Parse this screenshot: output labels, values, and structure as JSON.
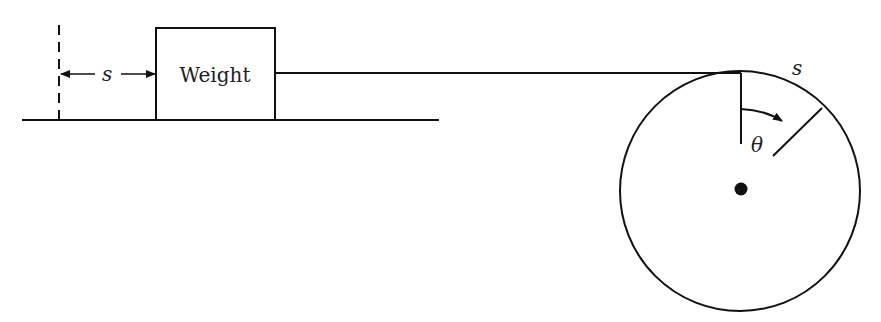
{
  "diagram": {
    "weight_label": "Weight",
    "displacement_label": "s",
    "arc_label": "s",
    "angle_label": "θ",
    "stroke_color": "#111111",
    "background": "#ffffff"
  }
}
